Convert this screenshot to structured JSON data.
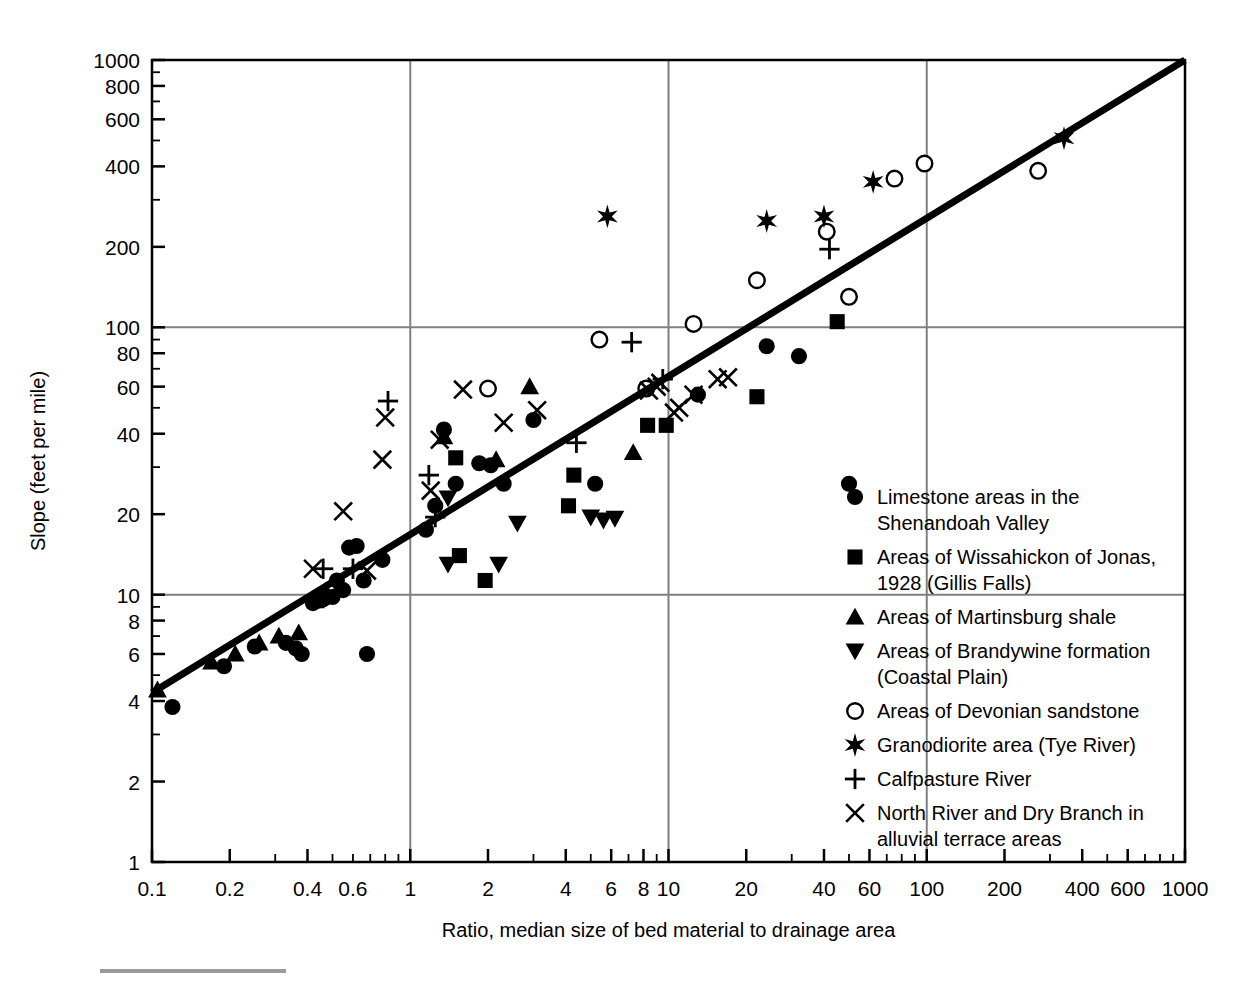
{
  "chart_data": {
    "type": "scatter",
    "title": "",
    "xlabel": "Ratio, median size of bed material to drainage area",
    "ylabel": "Slope (feet per mile)",
    "xscale": "log",
    "yscale": "log",
    "xlim": [
      0.1,
      1000
    ],
    "ylim": [
      1,
      1000
    ],
    "grid": true,
    "gridlines_x": [
      1,
      10,
      100
    ],
    "gridlines_y": [
      10,
      100
    ],
    "xticks": [
      0.1,
      0.2,
      0.4,
      0.6,
      1,
      2,
      4,
      6,
      8,
      10,
      20,
      40,
      60,
      100,
      200,
      400,
      600,
      1000
    ],
    "xtick_labels": [
      "0.1",
      "0.2",
      "0.4",
      "0.6",
      "1",
      "2",
      "4",
      "6",
      "8",
      "10",
      "20",
      "40",
      "60",
      "100",
      "200",
      "400",
      "600",
      "1000"
    ],
    "yticks": [
      1,
      2,
      4,
      6,
      8,
      10,
      20,
      40,
      60,
      80,
      100,
      200,
      400,
      600,
      800,
      1000
    ],
    "ytick_labels": [
      "1",
      "2",
      "4",
      "6",
      "8",
      "10",
      "20",
      "40",
      "60",
      "80",
      "100",
      "200",
      "400",
      "600",
      "800",
      "1000"
    ],
    "trendline": {
      "name": "fitted regression line",
      "x": [
        0.1,
        1000
      ],
      "y": [
        4.3,
        1000
      ]
    },
    "legend_position": "right-lower",
    "series": [
      {
        "name": "Limestone areas in the Shenandoah Valley",
        "marker": "filled-circle",
        "points": [
          [
            0.12,
            3.8
          ],
          [
            0.19,
            5.4
          ],
          [
            0.25,
            6.4
          ],
          [
            0.33,
            6.6
          ],
          [
            0.36,
            6.3
          ],
          [
            0.38,
            6.0
          ],
          [
            0.42,
            9.3
          ],
          [
            0.44,
            9.5
          ],
          [
            0.46,
            9.6
          ],
          [
            0.5,
            9.8
          ],
          [
            0.52,
            11.3
          ],
          [
            0.55,
            10.4
          ],
          [
            0.58,
            15.0
          ],
          [
            0.62,
            15.2
          ],
          [
            0.66,
            11.3
          ],
          [
            0.68,
            6.0
          ],
          [
            0.78,
            13.5
          ],
          [
            1.15,
            17.5
          ],
          [
            1.25,
            21.5
          ],
          [
            1.35,
            41.5
          ],
          [
            1.5,
            26.0
          ],
          [
            1.85,
            31.0
          ],
          [
            2.3,
            26.0
          ],
          [
            3.0,
            45.0
          ],
          [
            2.05,
            30.5
          ],
          [
            5.2,
            26.0
          ],
          [
            24.0,
            85.0
          ],
          [
            32.0,
            78.0
          ],
          [
            13.0,
            56.0
          ],
          [
            50.0,
            26.0
          ]
        ]
      },
      {
        "name": "Areas of Wissahickon of Jonas, 1928 (Gillis Falls)",
        "marker": "filled-square",
        "points": [
          [
            1.5,
            32.5
          ],
          [
            1.55,
            14.0
          ],
          [
            1.95,
            11.3
          ],
          [
            4.3,
            28.0
          ],
          [
            4.1,
            21.5
          ],
          [
            8.3,
            43.0
          ],
          [
            9.8,
            43.0
          ],
          [
            22.0,
            55.0
          ],
          [
            45.0,
            105.0
          ]
        ]
      },
      {
        "name": "Areas of Martinsburg shale",
        "marker": "filled-triangle-up",
        "points": [
          [
            0.105,
            4.4
          ],
          [
            0.17,
            5.6
          ],
          [
            0.21,
            6.0
          ],
          [
            0.26,
            6.6
          ],
          [
            0.31,
            7.0
          ],
          [
            0.37,
            7.2
          ],
          [
            0.43,
            9.5
          ],
          [
            0.47,
            10.3
          ],
          [
            0.53,
            10.6
          ],
          [
            1.35,
            39.0
          ],
          [
            2.9,
            60.0
          ],
          [
            2.15,
            32.0
          ],
          [
            7.3,
            34.0
          ]
        ]
      },
      {
        "name": "Areas of Brandywine formation (Coastal Plain)",
        "marker": "filled-triangle-down",
        "points": [
          [
            1.4,
            23.0
          ],
          [
            1.4,
            13.0
          ],
          [
            2.2,
            13.0
          ],
          [
            2.6,
            18.5
          ],
          [
            5.0,
            19.5
          ],
          [
            5.6,
            19.0
          ],
          [
            6.2,
            19.3
          ]
        ]
      },
      {
        "name": "Areas of Devonian sandstone",
        "marker": "open-circle",
        "points": [
          [
            2.0,
            59.0
          ],
          [
            5.4,
            90.0
          ],
          [
            8.2,
            59.0
          ],
          [
            12.5,
            103.0
          ],
          [
            22.0,
            150.0
          ],
          [
            41.0,
            228.0
          ],
          [
            50.0,
            130.0
          ],
          [
            75.0,
            360.0
          ],
          [
            98.0,
            410.0
          ],
          [
            270.0,
            385.0
          ]
        ]
      },
      {
        "name": "Granodiorite area (Tye River)",
        "marker": "star",
        "points": [
          [
            5.8,
            260.0
          ],
          [
            24.0,
            250.0
          ],
          [
            40.0,
            260.0
          ],
          [
            62.0,
            350.0
          ],
          [
            340.0,
            510.0
          ]
        ]
      },
      {
        "name": "Calfpasture River",
        "marker": "plus",
        "points": [
          [
            0.46,
            12.5
          ],
          [
            0.6,
            12.5
          ],
          [
            0.82,
            53.0
          ],
          [
            1.18,
            28.0
          ],
          [
            1.25,
            19.5
          ],
          [
            4.4,
            37.0
          ],
          [
            7.2,
            88.0
          ],
          [
            9.5,
            64.0
          ],
          [
            42.0,
            196.0
          ]
        ]
      },
      {
        "name": "North River and Dry Branch in alluvial terrace areas",
        "marker": "cross",
        "points": [
          [
            0.42,
            12.5
          ],
          [
            0.55,
            20.5
          ],
          [
            0.68,
            12.3
          ],
          [
            0.78,
            32.0
          ],
          [
            0.8,
            46.0
          ],
          [
            1.3,
            38.0
          ],
          [
            1.2,
            24.5
          ],
          [
            1.6,
            58.5
          ],
          [
            3.1,
            49.0
          ],
          [
            2.3,
            44.0
          ],
          [
            8.4,
            58.0
          ],
          [
            9.0,
            60.0
          ],
          [
            9.3,
            62.0
          ],
          [
            11.0,
            50.0
          ],
          [
            12.5,
            56.0
          ],
          [
            10.5,
            48.0
          ],
          [
            15.5,
            64.0
          ],
          [
            17.0,
            65.0
          ]
        ]
      }
    ]
  },
  "legend": {
    "items": [
      {
        "marker": "filled-circle",
        "lines": [
          "Limestone areas in the",
          "Shenandoah Valley"
        ]
      },
      {
        "marker": "filled-square",
        "lines": [
          "Areas of Wissahickon of Jonas,",
          "1928 (Gillis Falls)"
        ]
      },
      {
        "marker": "filled-triangle-up",
        "lines": [
          "Areas of Martinsburg shale"
        ]
      },
      {
        "marker": "filled-triangle-down",
        "lines": [
          "Areas of Brandywine formation",
          "(Coastal Plain)"
        ]
      },
      {
        "marker": "open-circle",
        "lines": [
          "Areas of Devonian sandstone"
        ]
      },
      {
        "marker": "star",
        "lines": [
          "Granodiorite area (Tye River)"
        ]
      },
      {
        "marker": "plus",
        "lines": [
          "Calfpasture River"
        ]
      },
      {
        "marker": "cross",
        "lines": [
          "North River and Dry Branch in",
          "alluvial terrace areas"
        ]
      }
    ]
  },
  "colors": {
    "ink": "#000000",
    "grid": "#808080",
    "footer_rule": "#9a9a9a",
    "background": "#ffffff"
  }
}
